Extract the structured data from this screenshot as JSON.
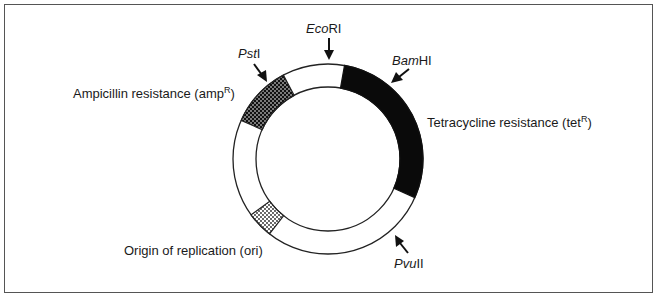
{
  "diagram": {
    "frame": {
      "border_color": "#555555",
      "background": "#ffffff"
    },
    "plasmid": {
      "center": [
        328,
        159
      ],
      "outer_radius": 95,
      "inner_radius": 72,
      "segments": [
        {
          "name": "ampicillin-resistance",
          "pattern": "checkered",
          "start_deg": 204,
          "end_deg": 242
        },
        {
          "name": "tetracycline-resistance",
          "pattern": "solid-black",
          "start_deg": 280,
          "end_deg": 384
        },
        {
          "name": "origin-of-replication",
          "pattern": "dotted",
          "start_deg": 128,
          "end_deg": 144
        }
      ]
    },
    "labels": {
      "ampicillin": {
        "text": "Ampicillin resistance (amp",
        "sup": "R",
        "close": ")"
      },
      "tetracycline": {
        "text": "Tetracycline resistance (tet",
        "sup": "R",
        "close": ")"
      },
      "origin": {
        "text": "Origin of replication (ori)"
      }
    },
    "restriction_sites": [
      {
        "id": "ecori",
        "italic": "Eco",
        "roman": "RI"
      },
      {
        "id": "psti",
        "italic": "Pst",
        "roman": "I"
      },
      {
        "id": "bamhi",
        "italic": "Bam",
        "roman": "HI"
      },
      {
        "id": "pvuii",
        "italic": "Pvu",
        "roman": "II"
      }
    ],
    "colors": {
      "ring_stroke": "#222222",
      "tet_fill": "#0a0a0a",
      "amp_pattern": "#111111",
      "ori_pattern": "#222222",
      "text": "#1a1a1a"
    }
  }
}
